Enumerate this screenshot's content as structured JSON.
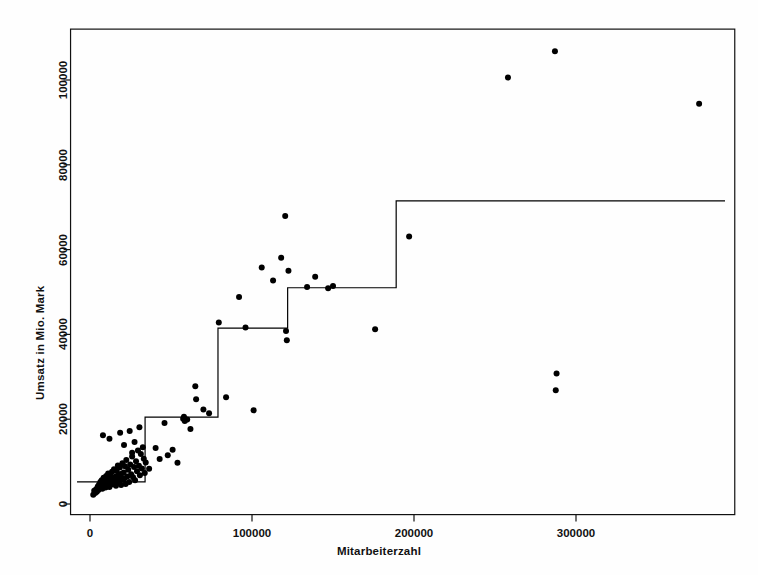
{
  "chart_data": {
    "type": "scatter",
    "title": "",
    "xlabel": "Mitarbeiterzahl",
    "ylabel": "Umsatz in Mio. Mark",
    "xlim": [
      -12000,
      398000
    ],
    "ylim": [
      -2500,
      112000
    ],
    "xticks": [
      0,
      100000,
      200000,
      300000
    ],
    "xtick_labels": [
      "0",
      "100000",
      "200000",
      "300000"
    ],
    "yticks": [
      0,
      20000,
      40000,
      60000,
      80000,
      100000
    ],
    "ytick_labels": [
      "0",
      "20000",
      "40000",
      "60000",
      "80000",
      "100000"
    ],
    "grid": false,
    "legend": null,
    "frame": "box",
    "marker": "filled-circle",
    "marker_color": "#000000",
    "line_color": "#000000",
    "series": [
      {
        "name": "Unternehmen",
        "type": "scatter",
        "points": [
          [
            2000,
            2200
          ],
          [
            2600,
            3100
          ],
          [
            3200,
            2600
          ],
          [
            3800,
            3500
          ],
          [
            4200,
            2900
          ],
          [
            4800,
            4100
          ],
          [
            5200,
            3300
          ],
          [
            5600,
            4600
          ],
          [
            6000,
            3800
          ],
          [
            6400,
            5200
          ],
          [
            6800,
            4300
          ],
          [
            7200,
            5600
          ],
          [
            7600,
            3600
          ],
          [
            8000,
            4900
          ],
          [
            8400,
            6200
          ],
          [
            8800,
            4200
          ],
          [
            9200,
            5400
          ],
          [
            9600,
            3900
          ],
          [
            10000,
            6600
          ],
          [
            10400,
            5100
          ],
          [
            10800,
            4400
          ],
          [
            11200,
            7200
          ],
          [
            11600,
            5800
          ],
          [
            12000,
            4000
          ],
          [
            12400,
            6900
          ],
          [
            12800,
            5300
          ],
          [
            13200,
            4600
          ],
          [
            13600,
            7600
          ],
          [
            14000,
            6100
          ],
          [
            14400,
            4800
          ],
          [
            14800,
            8200
          ],
          [
            15200,
            5500
          ],
          [
            15600,
            6400
          ],
          [
            16000,
            4300
          ],
          [
            16400,
            7800
          ],
          [
            16800,
            5900
          ],
          [
            17200,
            9100
          ],
          [
            17600,
            6700
          ],
          [
            18000,
            5000
          ],
          [
            18400,
            8600
          ],
          [
            18800,
            7100
          ],
          [
            19200,
            4500
          ],
          [
            19600,
            6200
          ],
          [
            20000,
            9600
          ],
          [
            20400,
            5700
          ],
          [
            20800,
            7400
          ],
          [
            21200,
            6000
          ],
          [
            21600,
            8900
          ],
          [
            22000,
            4700
          ],
          [
            22400,
            10400
          ],
          [
            23000,
            6500
          ],
          [
            23600,
            8100
          ],
          [
            24200,
            5200
          ],
          [
            24800,
            9300
          ],
          [
            25400,
            7000
          ],
          [
            26000,
            11200
          ],
          [
            26600,
            6300
          ],
          [
            27200,
            8700
          ],
          [
            27800,
            5600
          ],
          [
            28400,
            10100
          ],
          [
            29000,
            7700
          ],
          [
            29600,
            12600
          ],
          [
            30200,
            9000
          ],
          [
            30800,
            6800
          ],
          [
            31400,
            11800
          ],
          [
            32000,
            8400
          ],
          [
            32600,
            13400
          ],
          [
            33200,
            10700
          ],
          [
            33800,
            7300
          ],
          [
            34400,
            9800
          ],
          [
            8000,
            16200
          ],
          [
            12000,
            15400
          ],
          [
            18600,
            16800
          ],
          [
            21000,
            13900
          ],
          [
            24500,
            17200
          ],
          [
            27500,
            14600
          ],
          [
            30500,
            18100
          ],
          [
            26000,
            12100
          ],
          [
            36500,
            8300
          ],
          [
            40500,
            13200
          ],
          [
            43000,
            10600
          ],
          [
            46000,
            19100
          ],
          [
            48000,
            11500
          ],
          [
            51000,
            12800
          ],
          [
            54000,
            9700
          ],
          [
            57500,
            20100
          ],
          [
            58000,
            20600
          ],
          [
            58500,
            19600
          ],
          [
            60000,
            19900
          ],
          [
            62000,
            17700
          ],
          [
            65000,
            27800
          ],
          [
            65500,
            24700
          ],
          [
            70000,
            22300
          ],
          [
            73500,
            21400
          ],
          [
            79500,
            42800
          ],
          [
            84000,
            25200
          ],
          [
            92000,
            48800
          ],
          [
            96000,
            41600
          ],
          [
            101000,
            22100
          ],
          [
            106000,
            55800
          ],
          [
            113000,
            52700
          ],
          [
            118000,
            58100
          ],
          [
            120500,
            67900
          ],
          [
            121000,
            40800
          ],
          [
            121500,
            38600
          ],
          [
            122500,
            55000
          ],
          [
            134000,
            51200
          ],
          [
            139000,
            53600
          ],
          [
            147000,
            50900
          ],
          [
            150000,
            51400
          ],
          [
            176000,
            41200
          ],
          [
            197000,
            63100
          ],
          [
            258000,
            100600
          ],
          [
            287000,
            106800
          ],
          [
            288000,
            30800
          ],
          [
            287500,
            26800
          ],
          [
            376000,
            94400
          ]
        ]
      },
      {
        "name": "Regressionsbaum (Stufenfunktion)",
        "type": "step",
        "steps": [
          {
            "x_start": -8000,
            "x_end": 34000,
            "y": 5200
          },
          {
            "x_start": 34000,
            "x_end": 79000,
            "y": 20500
          },
          {
            "x_start": 79000,
            "x_end": 122000,
            "y": 41500
          },
          {
            "x_start": 122000,
            "x_end": 189000,
            "y": 51000
          },
          {
            "x_start": 189000,
            "x_end": 392000,
            "y": 71500
          }
        ]
      }
    ]
  }
}
